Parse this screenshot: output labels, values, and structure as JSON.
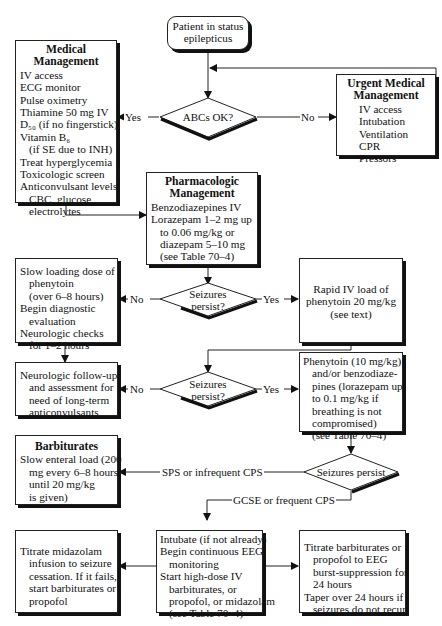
{
  "start": {
    "line1": "Patient in status",
    "line2": "epilepticus"
  },
  "abc_decision": {
    "label": "ABCs OK?",
    "yes": "Yes",
    "no": "No"
  },
  "medical_management": {
    "title1": "Medical",
    "title2": "Management",
    "items": [
      "IV access",
      "ECG monitor",
      "Pulse oximetry",
      "Thiamine 50 mg IV",
      "D₅₀ (if no fingerstick)",
      "Vitamin B₆",
      "(if SE due to INH)",
      "Treat hyperglycemia",
      "Toxicologic screen",
      "Anticonvulsant levels",
      "CBC, glucose,",
      "electrolytes"
    ]
  },
  "urgent_management": {
    "title1": "Urgent  Medical",
    "title2": "Management",
    "items": [
      "IV access",
      "Intubation",
      "Ventilation",
      "CPR",
      "Pressors"
    ]
  },
  "pharmacologic_management": {
    "title1": "Pharmacologic",
    "title2": "Management",
    "items": [
      "Benzodiazepines IV",
      "Lorazepam 1–2 mg up",
      "to 0.06 mg/kg or",
      "diazepam 5–10 mg",
      "(see Table 70–4)"
    ]
  },
  "seizure_decision_1": {
    "line1": "Seizures",
    "line2": "persist?",
    "yes": "Yes",
    "no": "No"
  },
  "slow_loading": {
    "items": [
      "Slow loading dose of",
      "phenytoin",
      "(over 6–8 hours)",
      "Begin diagnostic",
      "evaluation",
      "Neurologic checks",
      "for 1–2 hours"
    ]
  },
  "rapid_iv_load": {
    "items": [
      "Rapid IV load of",
      "phenytoin  20 mg/kg",
      "(see text)"
    ]
  },
  "seizure_decision_2": {
    "line1": "Seizures",
    "line2": "persist?",
    "yes": "Yes",
    "no": "No"
  },
  "neuro_followup": {
    "items": [
      "Neurologic follow-up",
      "and assessment for",
      "need of long-term",
      "anticonvulsants"
    ]
  },
  "phenytoin_benzo": {
    "items": [
      "Phenytoin (10 mg/kg)",
      "and/or benzodiaze-",
      "pines (lorazepam up",
      "to 0.1 mg/kg if",
      "breathing is not",
      "compromised)",
      "(see Table 70–4)"
    ]
  },
  "barbiturates": {
    "title": "Barbiturates",
    "items": [
      "Slow enteral load (200",
      "mg every 6–8 hours",
      "until 20 mg/kg",
      "is given)"
    ]
  },
  "seizure_decision_3": {
    "label": "Seizures persist",
    "branch_sps": "SPS or infrequent CPS",
    "branch_gcse": "GCSE or frequent CPS"
  },
  "intubate_eeg": {
    "items": [
      "Intubate (if not already)",
      "Begin continuous EEG",
      "monitoring",
      "Start high-dose IV",
      "barbiturates, or",
      "propofol, or midazolam",
      "(see Table 70–4)"
    ]
  },
  "midazolam": {
    "items": [
      "Titrate midazolam",
      "infusion to seizure",
      "cessation. If it fails,",
      "start barbiturates or",
      "propofol"
    ]
  },
  "burst_suppression": {
    "items": [
      "Titrate barbiturates or",
      "propofol to EEG",
      "burst-suppression for",
      "24 hours",
      "Taper over 24 hours if",
      "seizures do not recur"
    ]
  }
}
